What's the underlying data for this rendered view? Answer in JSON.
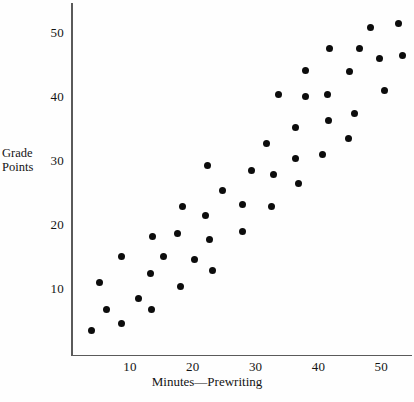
{
  "chart_data": {
    "type": "scatter",
    "title": "",
    "xlabel": "Minutes—Prewriting",
    "ylabel": "Grade Points",
    "xlim": [
      0,
      55
    ],
    "ylim": [
      0,
      54
    ],
    "xticks": [
      10,
      20,
      30,
      40,
      50
    ],
    "yticks": [
      10,
      20,
      30,
      40,
      50
    ],
    "xtick_labels": [
      "10",
      "20",
      "30",
      "40",
      "50"
    ],
    "ytick_labels": [
      "10",
      "20",
      "30",
      "40",
      "50"
    ],
    "grid": false,
    "legend": null,
    "marker": "filled-circle",
    "marker_color": "#0c0c0c",
    "points": [
      {
        "x": 3.9,
        "y": 3.4
      },
      {
        "x": 5.2,
        "y": 10.8
      },
      {
        "x": 6.3,
        "y": 6.7
      },
      {
        "x": 8.7,
        "y": 4.5
      },
      {
        "x": 8.7,
        "y": 14.9
      },
      {
        "x": 11.3,
        "y": 8.4
      },
      {
        "x": 13.2,
        "y": 12.3
      },
      {
        "x": 13.4,
        "y": 6.6
      },
      {
        "x": 13.6,
        "y": 18.1
      },
      {
        "x": 15.3,
        "y": 15.0
      },
      {
        "x": 17.6,
        "y": 18.5
      },
      {
        "x": 18.1,
        "y": 10.3
      },
      {
        "x": 18.3,
        "y": 22.7
      },
      {
        "x": 20.2,
        "y": 14.5
      },
      {
        "x": 22.0,
        "y": 21.4
      },
      {
        "x": 22.3,
        "y": 29.2
      },
      {
        "x": 23.2,
        "y": 12.8
      },
      {
        "x": 22.6,
        "y": 17.6
      },
      {
        "x": 24.7,
        "y": 25.2
      },
      {
        "x": 27.9,
        "y": 23.1
      },
      {
        "x": 27.9,
        "y": 18.8
      },
      {
        "x": 29.3,
        "y": 28.4
      },
      {
        "x": 31.7,
        "y": 32.6
      },
      {
        "x": 32.6,
        "y": 22.8
      },
      {
        "x": 32.8,
        "y": 27.8
      },
      {
        "x": 33.7,
        "y": 40.2
      },
      {
        "x": 36.3,
        "y": 35.1
      },
      {
        "x": 36.3,
        "y": 30.3
      },
      {
        "x": 36.8,
        "y": 26.4
      },
      {
        "x": 37.9,
        "y": 40.0
      },
      {
        "x": 38.0,
        "y": 44.0
      },
      {
        "x": 40.7,
        "y": 30.9
      },
      {
        "x": 41.5,
        "y": 40.3
      },
      {
        "x": 41.6,
        "y": 36.1
      },
      {
        "x": 41.8,
        "y": 47.5
      },
      {
        "x": 44.8,
        "y": 33.4
      },
      {
        "x": 44.9,
        "y": 43.8
      },
      {
        "x": 45.8,
        "y": 37.3
      },
      {
        "x": 46.6,
        "y": 47.5
      },
      {
        "x": 48.3,
        "y": 50.7
      },
      {
        "x": 49.8,
        "y": 45.9
      },
      {
        "x": 50.5,
        "y": 40.9
      },
      {
        "x": 52.8,
        "y": 51.3
      },
      {
        "x": 53.4,
        "y": 46.3
      }
    ]
  },
  "axes": {
    "y_title_line1": "Grade",
    "y_title_line2": "Points",
    "x_title": "Minutes—Prewriting"
  }
}
